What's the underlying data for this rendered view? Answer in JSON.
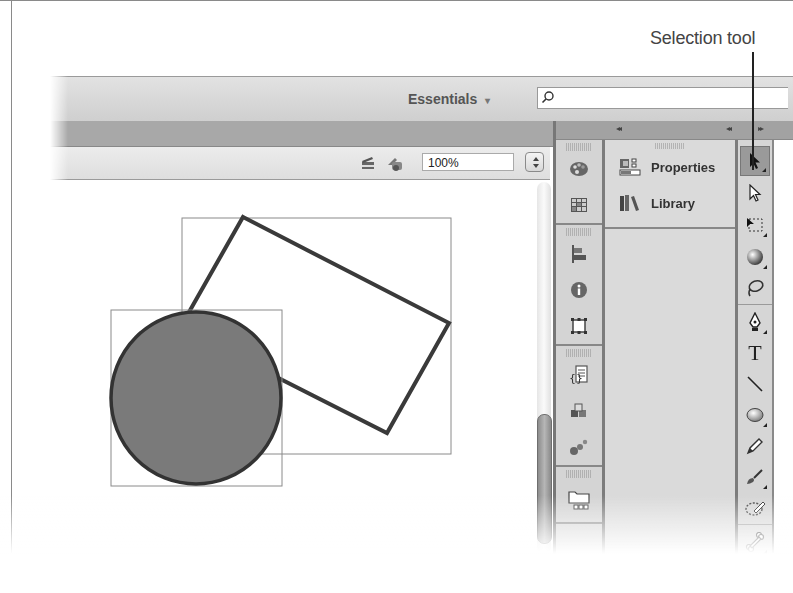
{
  "annotation": {
    "callout_label": "Selection tool"
  },
  "titlebar": {
    "workspace_label": "Essentials",
    "workspace_caret": "▾",
    "search_placeholder": "",
    "search_value": ""
  },
  "edit_bar": {
    "zoom_value": "100%",
    "edit_scene_icon": "clapperboard-icon",
    "edit_symbol_icon": "symbols-icon"
  },
  "stage": {
    "shapes": [
      {
        "type": "rectangle",
        "rotation_deg": 28,
        "fill": "#ffffff",
        "stroke": "#3a3a3a"
      },
      {
        "type": "circle",
        "fill": "#7a7a7a",
        "stroke": "#333333"
      }
    ]
  },
  "panels": {
    "collapse_glyph": "◂◂",
    "expand_glyph": "▸▸",
    "icon_dock": [
      {
        "group": 1,
        "items": [
          "color-swatch-palette-icon",
          "swatches-grid-icon"
        ]
      },
      {
        "group": 2,
        "items": [
          "align-icon",
          "info-icon",
          "transform-icon"
        ]
      },
      {
        "group": 3,
        "items": [
          "actions-code-icon",
          "components-icon",
          "motion-presets-icon"
        ]
      },
      {
        "group": 4,
        "items": [
          "project-folder-icon"
        ]
      }
    ],
    "tabs": [
      {
        "label": "Properties",
        "icon": "properties-icon"
      },
      {
        "label": "Library",
        "icon": "library-icon"
      }
    ]
  },
  "tools": [
    {
      "name": "selection-tool",
      "active": true,
      "has_flyout": true
    },
    {
      "name": "subselection-tool",
      "active": false,
      "has_flyout": false
    },
    {
      "name": "free-transform-tool",
      "active": false,
      "has_flyout": true
    },
    {
      "name": "3d-rotation-tool",
      "active": false,
      "has_flyout": true
    },
    {
      "name": "lasso-tool",
      "active": false,
      "has_flyout": false
    },
    {
      "name": "pen-tool",
      "active": false,
      "has_flyout": true
    },
    {
      "name": "text-tool",
      "active": false,
      "has_flyout": false,
      "glyph": "T"
    },
    {
      "name": "line-tool",
      "active": false,
      "has_flyout": false
    },
    {
      "name": "oval-tool",
      "active": false,
      "has_flyout": true
    },
    {
      "name": "pencil-tool",
      "active": false,
      "has_flyout": false
    },
    {
      "name": "brush-tool",
      "active": false,
      "has_flyout": true
    },
    {
      "name": "deco-tool",
      "active": false,
      "has_flyout": false
    },
    {
      "name": "bone-tool",
      "active": false,
      "has_flyout": true
    },
    {
      "name": "paint-bucket-tool",
      "active": false,
      "has_flyout": false
    }
  ],
  "colors": {
    "panel_bg": "#d6d6d6",
    "dark_divider": "#7c7c7c",
    "stage_bg": "#ffffff",
    "circle_fill": "#7a7a7a"
  }
}
